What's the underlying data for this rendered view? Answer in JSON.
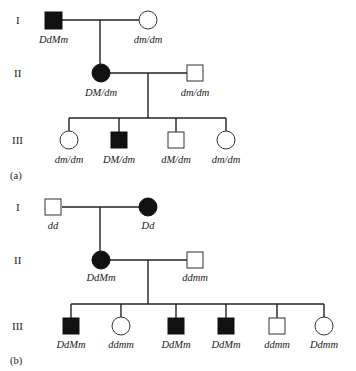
{
  "panels": [
    {
      "label": "(a)",
      "generations": [
        "I",
        "II",
        "III"
      ],
      "individuals": {
        "I1": {
          "sex": "male",
          "affected": true,
          "genotype": "DdMm"
        },
        "I2": {
          "sex": "female",
          "affected": false,
          "genotype": "dm/dm"
        },
        "II1": {
          "sex": "female",
          "affected": true,
          "genotype": "DM/dm"
        },
        "II2": {
          "sex": "male",
          "affected": false,
          "genotype": "dm/dm"
        },
        "III": [
          {
            "sex": "female",
            "affected": false,
            "genotype": "dm/dm"
          },
          {
            "sex": "male",
            "affected": true,
            "genotype": "DM/dm"
          },
          {
            "sex": "male",
            "affected": false,
            "genotype": "dM/dm"
          },
          {
            "sex": "female",
            "affected": false,
            "genotype": "dm/dm"
          }
        ]
      }
    },
    {
      "label": "(b)",
      "generations": [
        "I",
        "II",
        "III"
      ],
      "individuals": {
        "I1": {
          "sex": "male",
          "affected": false,
          "genotype": "dd"
        },
        "I2": {
          "sex": "female",
          "affected": true,
          "genotype": "Dd"
        },
        "II1": {
          "sex": "female",
          "affected": true,
          "genotype": "DdMm"
        },
        "II2": {
          "sex": "male",
          "affected": false,
          "genotype": "ddmm"
        },
        "III": [
          {
            "sex": "male",
            "affected": true,
            "genotype": "DdMm"
          },
          {
            "sex": "female",
            "affected": false,
            "genotype": "ddmm"
          },
          {
            "sex": "male",
            "affected": true,
            "genotype": "DdMm"
          },
          {
            "sex": "male",
            "affected": true,
            "genotype": "DdMm"
          },
          {
            "sex": "male",
            "affected": false,
            "genotype": "ddmm"
          },
          {
            "sex": "female",
            "affected": false,
            "genotype": "Ddmm"
          }
        ]
      }
    }
  ]
}
